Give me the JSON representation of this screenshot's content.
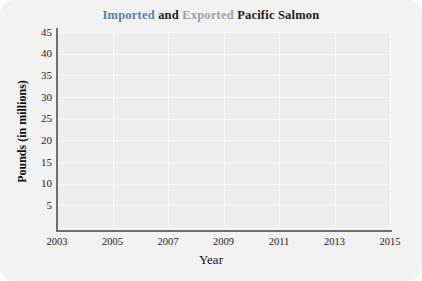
{
  "title": {
    "part_imported": "Imported",
    "part_and": " and ",
    "part_exported": "Exported",
    "part_rest": " Pacific Salmon",
    "full": "Imported and Exported Pacific Salmon"
  },
  "colors": {
    "imported_text": "#5b7fa6",
    "exported_text": "#9aa3a8",
    "line_imported": "#7b7b7b",
    "line_exported": "#6f6f6f",
    "plot_background": "#ededed",
    "card_background": "#f2f2f2",
    "axis": "#6e6e6e",
    "gridline": "#fafafa"
  },
  "chart_data": {
    "type": "line",
    "title": "Imported and Exported Pacific Salmon",
    "xlabel": "Year",
    "ylabel": "Pounds (in millions)",
    "x": [
      2003,
      2004,
      2005,
      2006,
      2007,
      2008,
      2009,
      2010,
      2011,
      2012,
      2013,
      2014
    ],
    "xlim": [
      2003,
      2015
    ],
    "ylim": [
      0,
      45
    ],
    "xticks": [
      2003,
      2005,
      2007,
      2009,
      2011,
      2013,
      2015
    ],
    "xtick_labels": [
      "2003",
      "2005",
      "2007",
      "2009",
      "2011",
      "2013",
      "2015"
    ],
    "yticks": [
      5,
      10,
      15,
      20,
      25,
      30,
      35,
      40,
      45
    ],
    "ytick_labels": [
      "5",
      "10",
      "15",
      "20",
      "25",
      "30",
      "35",
      "40",
      "45"
    ],
    "grid": true,
    "legend": "none",
    "series": [
      {
        "name": "Imported",
        "values": [
          40,
          32,
          19,
          20,
          16,
          12.5,
          12,
          19.5,
          21,
          10,
          12,
          10.5
        ]
      },
      {
        "name": "Exported",
        "values": [
          21,
          22,
          22,
          20.5,
          17.5,
          16,
          12,
          19.5,
          21,
          21,
          24,
          14.5
        ]
      }
    ]
  }
}
